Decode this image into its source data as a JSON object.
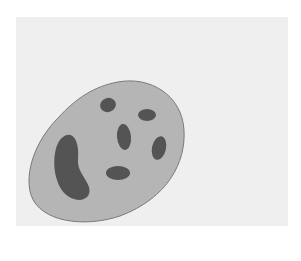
{
  "diagram": {
    "labels": {
      "allergen": "allergen",
      "ige": "IgE",
      "fcer": "FcεR",
      "degranulation": "degranulation",
      "granules": "granules contain histamine, heparin and enzymes",
      "mast_cell": "mast cell"
    },
    "colors": {
      "panel": "#efefef",
      "cell_fill": "#b5b5b5",
      "cell_outline": "#7a7a7a",
      "granule": "#545454",
      "receptor": "#2b2b2b",
      "antibody": "#8c8c8c",
      "allergen": "#d8d8d8",
      "arrow": "#111111"
    }
  }
}
